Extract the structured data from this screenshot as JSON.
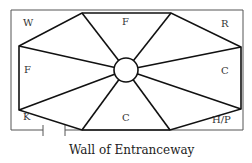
{
  "diagram": {
    "labels": {
      "top_left": "W",
      "top": "F",
      "top_right": "R",
      "left": "F",
      "right": "C",
      "bottom_left": "K",
      "bottom": "C",
      "bottom_right": "H/P"
    },
    "caption": "Wall of Entranceway",
    "line_color": "#111111",
    "wall_color": "#555555"
  }
}
